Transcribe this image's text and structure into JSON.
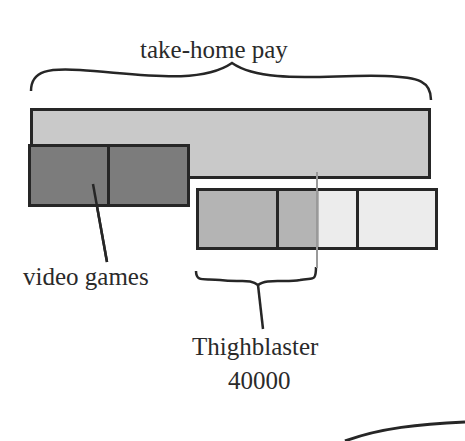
{
  "diagram": {
    "title_label": "take-home pay",
    "video_games_label": "video games",
    "thighblaster_label_line1": "Thighblaster",
    "thighblaster_label_line2": "40000",
    "colors": {
      "take_home_bar": "#c9c9c9",
      "video_games_bar": "#7c7c7c",
      "thighblaster_paid": "#b4b4b4",
      "thighblaster_unpaid": "#ececec",
      "outline": "#262626",
      "marker_line": "#9a9a9a"
    },
    "bars": [
      {
        "name": "take-home pay",
        "segments": 1
      },
      {
        "name": "video games",
        "segments": 2
      },
      {
        "name": "Thighblaster 40000",
        "segments": 4
      }
    ]
  }
}
